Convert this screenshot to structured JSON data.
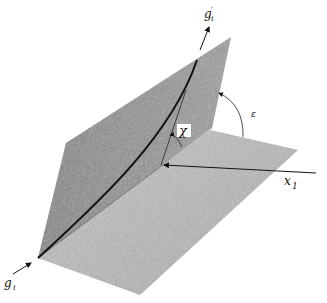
{
  "figure": {
    "labels": {
      "g_prime": "g",
      "g_prime_sub": "i",
      "g_prime_mark": "′",
      "g": "g",
      "g_sub": "i",
      "x1": "x",
      "x1_sub": "1",
      "chi": "χ",
      "epsilon": "ε"
    },
    "colors": {
      "vertical_plane": "#8c8c8c",
      "horizontal_plane": "#b4b4b4",
      "curve": "#111111",
      "background": "#ffffff"
    }
  }
}
